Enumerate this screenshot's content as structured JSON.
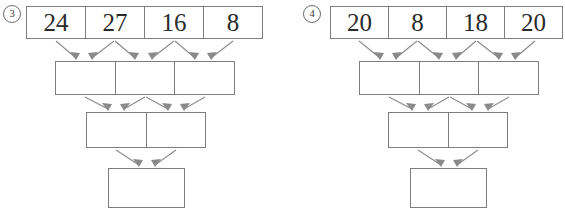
{
  "worksheet": {
    "title": "addition pyramid worksheet",
    "background_color": "#ffffff",
    "box_border_color": "#7d7d7d",
    "number_color": "#2b2b2b",
    "arrow_color": "#8a8a8a"
  },
  "problems": [
    {
      "label": "3",
      "label_icon": "circled-number-3",
      "rows": [
        {
          "name": "top-row",
          "cells": [
            "24",
            "27",
            "16",
            "8"
          ]
        },
        {
          "name": "second-row",
          "cells": [
            "",
            "",
            ""
          ]
        },
        {
          "name": "third-row",
          "cells": [
            "",
            ""
          ]
        },
        {
          "name": "bottom-row",
          "cells": [
            ""
          ]
        }
      ],
      "arrow_pairs": [
        {
          "from": 0,
          "to": 0
        },
        {
          "from": 1,
          "to": 0
        },
        {
          "from": 1,
          "to": 1
        },
        {
          "from": 2,
          "to": 1
        },
        {
          "from": 2,
          "to": 2
        },
        {
          "from": 3,
          "to": 2
        }
      ]
    },
    {
      "label": "4",
      "label_icon": "circled-number-4",
      "rows": [
        {
          "name": "top-row",
          "cells": [
            "20",
            "8",
            "18",
            "20"
          ]
        },
        {
          "name": "second-row",
          "cells": [
            "",
            "",
            ""
          ]
        },
        {
          "name": "third-row",
          "cells": [
            "",
            ""
          ]
        },
        {
          "name": "bottom-row",
          "cells": [
            ""
          ]
        }
      ],
      "arrow_pairs": [
        {
          "from": 0,
          "to": 0
        },
        {
          "from": 1,
          "to": 0
        },
        {
          "from": 1,
          "to": 1
        },
        {
          "from": 2,
          "to": 1
        },
        {
          "from": 2,
          "to": 2
        },
        {
          "from": 3,
          "to": 2
        }
      ]
    }
  ]
}
